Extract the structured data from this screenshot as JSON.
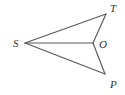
{
  "figure": {
    "background_color": "#ffffff",
    "line_color": "#595959",
    "label_color": "#333333",
    "canvas": {
      "width": 125,
      "height": 95
    },
    "points": [
      {
        "id": "S",
        "label": "S",
        "x": 25,
        "y": 43,
        "label_x": 13,
        "label_y": 47
      },
      {
        "id": "T",
        "label": "T",
        "x": 106,
        "y": 14,
        "label_x": 110,
        "label_y": 12
      },
      {
        "id": "O",
        "label": "O",
        "x": 93,
        "y": 43,
        "label_x": 99,
        "label_y": 48
      },
      {
        "id": "P",
        "label": "P",
        "x": 105,
        "y": 74,
        "label_x": 110,
        "label_y": 88
      }
    ],
    "segments": [
      {
        "id": "ST",
        "from": "S",
        "to": "T"
      },
      {
        "id": "SO",
        "from": "S",
        "to": "O"
      },
      {
        "id": "SP",
        "from": "S",
        "to": "P"
      },
      {
        "id": "TO",
        "from": "T",
        "to": "O"
      },
      {
        "id": "OP",
        "from": "O",
        "to": "P"
      }
    ]
  }
}
